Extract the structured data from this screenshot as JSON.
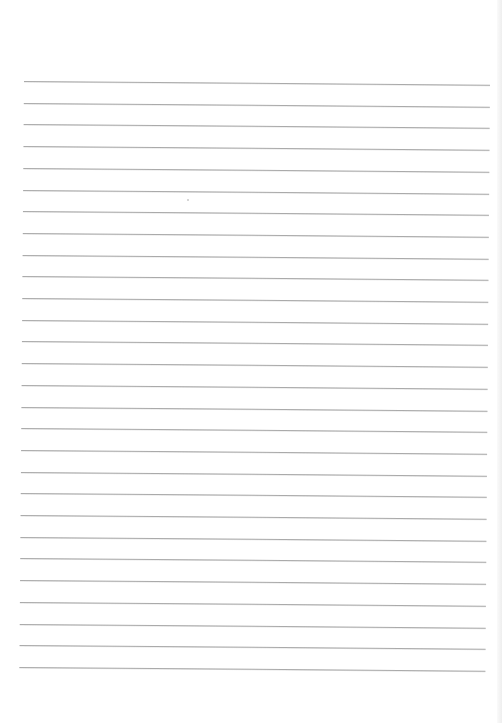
{
  "document": {
    "type": "lined-paper",
    "background_color": "#ffffff",
    "line_color": "#aaaaaa",
    "line_count": 28,
    "first_line_y": 81,
    "line_spacing": 21.7,
    "line_left_x": 24,
    "line_width": 466,
    "text_content": ""
  }
}
